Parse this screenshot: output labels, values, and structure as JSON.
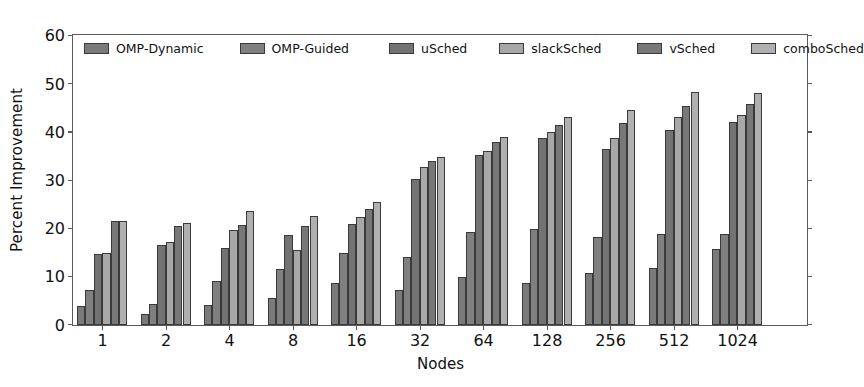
{
  "chart_data": {
    "type": "bar",
    "title": "",
    "xlabel": "Nodes",
    "ylabel": "Percent Improvement",
    "categories": [
      "1",
      "2",
      "4",
      "8",
      "16",
      "32",
      "64",
      "128",
      "256",
      "512",
      "1024"
    ],
    "ylim": [
      0,
      60
    ],
    "yticks": [
      0,
      10,
      20,
      30,
      40,
      50,
      60
    ],
    "grid": false,
    "legend_position": "upper-left-inside",
    "series": [
      {
        "name": "OMP-Dynamic",
        "color": "#7a7a7a",
        "values": [
          4.0,
          2.2,
          4.2,
          5.6,
          8.7,
          7.3,
          10.0,
          8.7,
          10.7,
          11.8,
          15.7
        ]
      },
      {
        "name": "OMP-Guided",
        "color": "#808080",
        "values": [
          7.2,
          4.4,
          9.2,
          11.6,
          14.9,
          14.1,
          19.4,
          20.0,
          18.3,
          18.8,
          18.9
        ]
      },
      {
        "name": "uSched",
        "color": "#737373",
        "values": [
          14.8,
          16.5,
          16.0,
          18.6,
          21.0,
          30.2,
          35.3,
          38.7,
          36.5,
          40.5,
          42.2
        ]
      },
      {
        "name": "slackSched",
        "color": "#a8a8a8",
        "values": [
          14.9,
          17.2,
          19.7,
          15.5,
          22.5,
          32.8,
          36.2,
          40.0,
          38.7,
          43.2,
          43.5
        ]
      },
      {
        "name": "vSched",
        "color": "#787878",
        "values": [
          21.5,
          20.6,
          20.7,
          20.5,
          24.1,
          34.0,
          38.0,
          41.5,
          42.0,
          45.5,
          45.8
        ]
      },
      {
        "name": "comboSched",
        "color": "#b0b0b0",
        "values": [
          21.5,
          21.1,
          23.7,
          22.7,
          25.6,
          34.9,
          39.0,
          43.2,
          44.7,
          48.3,
          48.1
        ]
      }
    ]
  },
  "axes": {
    "y_tick_labels": [
      "0",
      "10",
      "20",
      "30",
      "40",
      "50",
      "60"
    ],
    "x_tick_labels": [
      "1",
      "2",
      "4",
      "8",
      "16",
      "32",
      "64",
      "128",
      "256",
      "512",
      "1024"
    ],
    "y_title": "Percent Improvement",
    "x_title": "Nodes"
  },
  "legend": {
    "entries": [
      {
        "label": "OMP-Dynamic"
      },
      {
        "label": "OMP-Guided"
      },
      {
        "label": "uSched"
      },
      {
        "label": "slackSched"
      },
      {
        "label": "vSched"
      },
      {
        "label": "comboSched"
      }
    ]
  },
  "style": {
    "frame_color": "#5a5a5a",
    "bar_edge_color": "#3a3a3a",
    "background": "#ffffff",
    "text_color": "#111111"
  }
}
